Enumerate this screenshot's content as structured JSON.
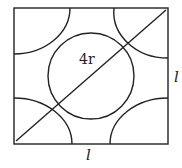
{
  "diagram": {
    "labels": {
      "diagonal": "4r",
      "bottom_side": "l",
      "right_side": "l"
    },
    "stroke_color": "#222222"
  }
}
